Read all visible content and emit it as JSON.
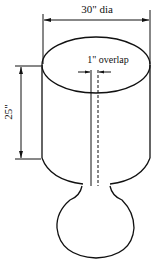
{
  "diagram": {
    "labels": {
      "diameter": "30\" dia",
      "height": "25\"",
      "overlap": "1\" overlap"
    },
    "colors": {
      "line": "#111111",
      "background": "#ffffff"
    }
  }
}
